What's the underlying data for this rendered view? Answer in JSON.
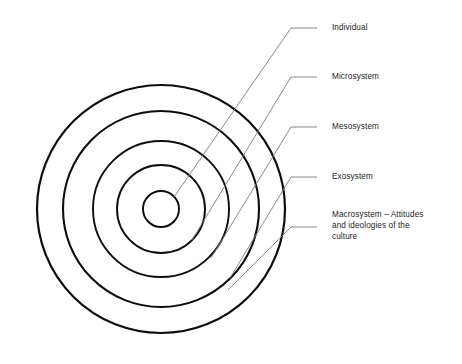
{
  "diagram": {
    "background_color": "#ffffff",
    "ring_stroke_color": "#0d0d0d",
    "leader_line_color": "#7b7b7b",
    "label_text_color": "#262626",
    "center": {
      "x": 161,
      "y": 209
    },
    "rings": [
      {
        "name": "individual-ring",
        "radius": 18,
        "stroke_width": 1.9
      },
      {
        "name": "microsystem-ring",
        "radius": 44,
        "stroke_width": 1.9
      },
      {
        "name": "mesosystem-ring",
        "radius": 68,
        "stroke_width": 1.9
      },
      {
        "name": "exosystem-ring",
        "radius": 98,
        "stroke_width": 2.1
      },
      {
        "name": "macrosystem-ring",
        "radius": 124,
        "stroke_width": 2.2
      }
    ],
    "labels": [
      {
        "id": "individual",
        "text": "Individual",
        "ring_index": 0,
        "leader": {
          "start_x": 174,
          "start_y": 197,
          "elbow_x": 291,
          "elbow_y": 28,
          "end_x": 317,
          "end_y": 28
        },
        "text_x": 332,
        "text_y": 22
      },
      {
        "id": "microsystem",
        "text": "Microsystem",
        "ring_index": 1,
        "leader": {
          "start_x": 192,
          "start_y": 240,
          "elbow_x": 291,
          "elbow_y": 77,
          "end_x": 317,
          "end_y": 77
        },
        "text_x": 332,
        "text_y": 71
      },
      {
        "id": "mesosystem",
        "text": "Mesosystem",
        "ring_index": 2,
        "leader": {
          "start_x": 211,
          "start_y": 258,
          "elbow_x": 291,
          "elbow_y": 127,
          "end_x": 317,
          "end_y": 127
        },
        "text_x": 332,
        "text_y": 121
      },
      {
        "id": "exosystem",
        "text": "Exosystem",
        "ring_index": 3,
        "leader": {
          "start_x": 230,
          "start_y": 278,
          "elbow_x": 291,
          "elbow_y": 177,
          "end_x": 317,
          "end_y": 177
        },
        "text_x": 332,
        "text_y": 171
      },
      {
        "id": "macrosystem",
        "text": "Macrosystem – Attitudes\nand ideologies of the\nculture",
        "ring_index": 4,
        "leader": {
          "start_x": 228,
          "start_y": 290,
          "elbow_x": 291,
          "elbow_y": 227,
          "end_x": 317,
          "end_y": 227
        },
        "text_x": 332,
        "text_y": 209
      }
    ]
  }
}
